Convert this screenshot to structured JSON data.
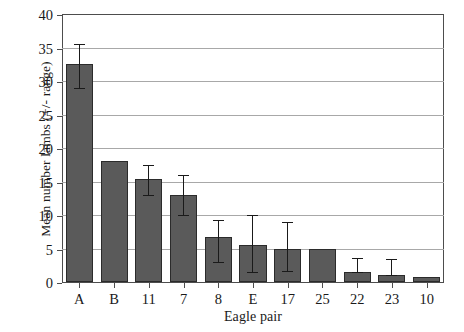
{
  "chart_data": {
    "type": "bar",
    "title": "",
    "xlabel": "Eagle pair",
    "ylabel": "Mean number lambs (+/- range)",
    "categories": [
      "A",
      "B",
      "11",
      "7",
      "8",
      "E",
      "17",
      "25",
      "22",
      "23",
      "10"
    ],
    "values": [
      32.5,
      18.0,
      15.4,
      13.0,
      6.7,
      5.5,
      5.0,
      5.0,
      1.5,
      1.0,
      0.8
    ],
    "error_low": [
      29.0,
      null,
      13.0,
      10.0,
      3.0,
      1.5,
      1.7,
      null,
      1.5,
      1.0,
      null
    ],
    "error_high": [
      35.5,
      null,
      17.5,
      16.0,
      9.3,
      10.0,
      9.0,
      null,
      3.6,
      3.5,
      null
    ],
    "ylim": [
      0,
      40
    ],
    "yticks": [
      0,
      5,
      10,
      15,
      20,
      25,
      30,
      35,
      40
    ],
    "ytick_labels": [
      "0",
      "5",
      "10",
      "15",
      "20",
      "25",
      "30",
      "35",
      "40"
    ],
    "grid": true,
    "grid_axis": "y",
    "legend": null,
    "bar_color": "#5a5a5a",
    "bar_edge_color": "#2b2b2b",
    "grid_color": "#a8a8a8",
    "axis_color": "#4d4d4d"
  }
}
